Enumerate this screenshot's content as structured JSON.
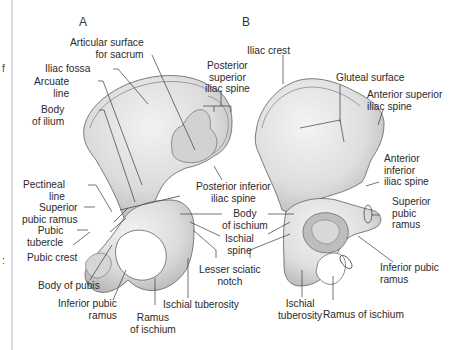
{
  "figure": {
    "panels": [
      {
        "id": "A",
        "label": "A"
      },
      {
        "id": "B",
        "label": "B"
      }
    ],
    "edge_fragments": [
      "f",
      ":"
    ],
    "colors": {
      "bone_fill": "#e6e6e6",
      "bone_shadow": "#bdbdbd",
      "bone_outline": "#6e6e6e",
      "leader_line": "#3a3a3a",
      "margin_rule": "#b9b9d6",
      "text": "#2a2a2a"
    }
  },
  "labels_a": {
    "articular_surface": "Articular surface\nfor sacrum",
    "iliac_fossa": "Iliac fossa",
    "arcuate_line": "Arcuate\nline",
    "body_of_ilium": "Body\nof ilium",
    "posterior_superior_iliac_spine": "Posterior\nsuperior\niliac spine",
    "posterior_inferior_iliac_spine": "Posterior inferior\niliac spine",
    "pectineal_line": "Pectineal\nline",
    "superior_pubic_ramus": "Superior\npubic ramus",
    "pubic_tubercle": "Pubic\ntubercle",
    "pubic_crest": "Pubic crest",
    "body_of_pubis": "Body of pubis",
    "inferior_pubic_ramus": "Inferior pubic\nramus",
    "ramus_of_ischium": "Ramus\nof ischium",
    "ischial_tuberosity": "Ischial tuberosity",
    "body_of_ischium": "Body\nof ischium",
    "ischial_spine": "Ischial\nspine",
    "lesser_sciatic_notch": "Lesser sciatic\nnotch"
  },
  "labels_b": {
    "iliac_crest": "Iliac crest",
    "gluteal_surface": "Gluteal surface",
    "anterior_superior_iliac_spine": "Anterior superior\niliac spine",
    "anterior_inferior_iliac_spine": "Anterior\ninferior\niliac spine",
    "superior_pubic_ramus": "Superior\npubic\nramus",
    "inferior_pubic_ramus": "Inferior pubic\nramus",
    "ischial_tuberosity": "Ischial\ntuberosity",
    "ramus_of_ischium": "Ramus of ischium"
  }
}
